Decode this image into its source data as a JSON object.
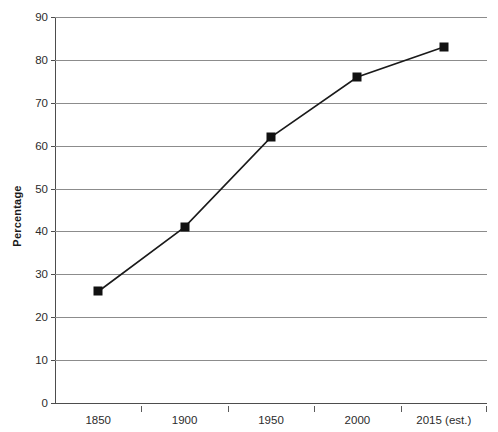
{
  "chart_data": {
    "type": "line",
    "title": "",
    "xlabel": "",
    "ylabel": "Percentage",
    "categories": [
      "1850",
      "1900",
      "1950",
      "2000",
      "2015 (est.)"
    ],
    "values": [
      26,
      41,
      62,
      76,
      83
    ],
    "series": [
      {
        "name": "Percentage",
        "values": [
          26,
          41,
          62,
          76,
          83
        ],
        "marker": "filled-square",
        "marker_color": "#111111",
        "line_color": "#1a1a1a"
      }
    ],
    "ylim": [
      0,
      90
    ],
    "ytick_step": 10,
    "yticks": [
      0,
      10,
      20,
      30,
      40,
      50,
      60,
      70,
      80,
      90
    ],
    "ytick_labels": [
      "0",
      "10",
      "20",
      "30",
      "40",
      "50",
      "60",
      "70",
      "80",
      "90"
    ],
    "grid": "horizontal",
    "grid_color": "#8c8c8c",
    "legend": "none",
    "background": "#ffffff",
    "axis_color": "#4d4d4d"
  }
}
